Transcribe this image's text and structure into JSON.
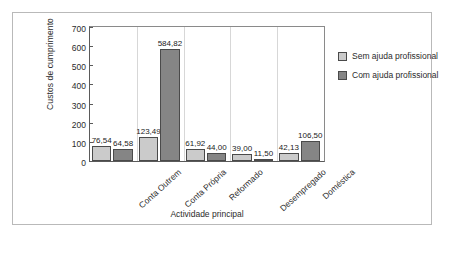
{
  "chart_data": {
    "type": "bar",
    "title": "",
    "xlabel": "Actividade principal",
    "ylabel": "Custos de cumprimento",
    "categories": [
      "Conta Outrem",
      "Conta Própria",
      "Reformado",
      "Desempregado",
      "Doméstica"
    ],
    "series": [
      {
        "name": "Sem ajuda profissional",
        "color": "#cbcbcb",
        "values": [
          76.54,
          123.49,
          61.92,
          39.0,
          42.13
        ],
        "labels": [
          "76,54",
          "123,49",
          "61,92",
          "39,00",
          "42,13"
        ]
      },
      {
        "name": "Com ajuda profissional",
        "color": "#858585",
        "values": [
          64.58,
          584.82,
          44.0,
          11.5,
          106.5
        ],
        "labels": [
          "64,58",
          "584,82",
          "44,00",
          "11,50",
          "106,50"
        ]
      }
    ],
    "ylim": [
      0,
      700
    ],
    "yticks": [
      0,
      100,
      200,
      300,
      400,
      500,
      600,
      700
    ],
    "ytick_labels": [
      "0",
      "100",
      "200",
      "300",
      "400",
      "500",
      "600",
      "700"
    ],
    "grid": false,
    "legend_position": "right"
  }
}
